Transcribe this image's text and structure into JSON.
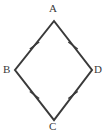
{
  "figure": {
    "kind": "geometry-diagram",
    "shape_name": "rhombus",
    "background_color": "#ffffff",
    "stroke_color": "#3a3a3a",
    "label_color": "#3a3a3a",
    "stroke_width": 2,
    "tick_stroke_width": 1.4,
    "canvas": {
      "width": 108,
      "height": 136
    },
    "vertices": [
      {
        "id": "A",
        "label": "A",
        "x": 54,
        "y": 21,
        "position": "top"
      },
      {
        "id": "B",
        "label": "B",
        "x": 15,
        "y": 70,
        "position": "left"
      },
      {
        "id": "C",
        "label": "C",
        "x": 54,
        "y": 120,
        "position": "bottom"
      },
      {
        "id": "D",
        "label": "D",
        "x": 92,
        "y": 70,
        "position": "right"
      }
    ],
    "sides": [
      {
        "id": "AB",
        "from": "A",
        "to": "B",
        "tick_count": 1,
        "tick_center_x": 34.5,
        "tick_center_y": 45.5
      },
      {
        "id": "AD",
        "from": "A",
        "to": "D",
        "tick_count": 1,
        "tick_center_x": 73.0,
        "tick_center_y": 45.5
      },
      {
        "id": "BC",
        "from": "B",
        "to": "C",
        "tick_count": 1,
        "tick_center_x": 34.5,
        "tick_center_y": 95.0
      },
      {
        "id": "CD",
        "from": "C",
        "to": "D",
        "tick_count": 1,
        "tick_center_x": 73.0,
        "tick_center_y": 95.0
      }
    ],
    "tick_marks": {
      "style": "single-slash",
      "meaning": "congruent sides",
      "length": 11
    },
    "polygon_points": "54,21 92,70 54,120 15,70"
  }
}
